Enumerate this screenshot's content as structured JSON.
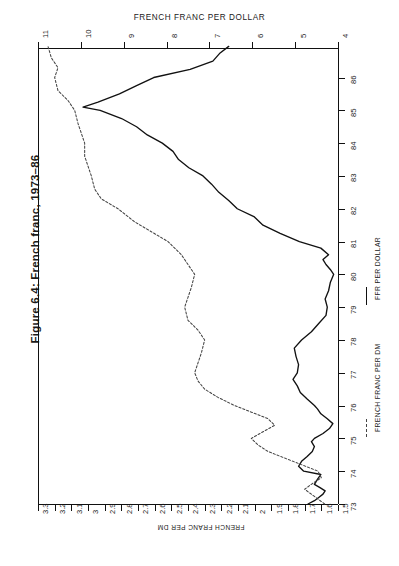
{
  "figure": {
    "caption": "Figure 6.4: French franc, 1973–86",
    "title": "FRENCH FRANC PER DOLLAR",
    "bottom_axis_label": "FRENCH FRANC PER DM"
  },
  "legend": {
    "solid_label": "FFR PER DOLLAR",
    "solid_marker": "solid-line-swatch",
    "dotted_label": "FRENCH FRANC PER DM",
    "dotted_marker": "dashed-line-swatch"
  },
  "colors": {
    "ink": "#111111",
    "dotted_ink": "#444444",
    "paper": "#ffffff"
  },
  "chart_data": {
    "type": "line",
    "orientation": "rotated-90-ccw",
    "title": "FRENCH FRANC PER DOLLAR",
    "xlabel": "",
    "ylabel": "",
    "grid": false,
    "legend_position": "right-inside",
    "time_axis": {
      "name": "year",
      "ticks": [
        "73",
        "74",
        "75",
        "76",
        "77",
        "78",
        "79",
        "80",
        "81",
        "82",
        "83",
        "84",
        "85",
        "86"
      ],
      "range": [
        1973,
        1986.9
      ],
      "direction": "bottom-to-top"
    },
    "value_axis_top": {
      "name": "FRENCH FRANC PER DOLLAR",
      "ticks": [
        "11",
        "10",
        "9",
        "8",
        "7",
        "6",
        "5",
        "4"
      ],
      "range": [
        11,
        4
      ],
      "direction": "left-to-right-descending"
    },
    "value_axis_bottom": {
      "name": "FRENCH FRANC PER DM",
      "ticks": [
        "3.3",
        "3.2",
        "3.1",
        "3",
        "2.9",
        "2.8",
        "2.7",
        "2.6",
        "2.5",
        "2.4",
        "2.3",
        "2.2",
        "2.1",
        "2",
        "1.9",
        "1.8",
        "1.7",
        "1.6",
        "1.5"
      ],
      "range": [
        3.3,
        1.5
      ],
      "direction": "left-to-right-descending"
    },
    "series": [
      {
        "name": "FFR PER DOLLAR",
        "style": "solid",
        "unit": "francs per US dollar",
        "x": [
          1973.0,
          1973.1,
          1973.2,
          1973.3,
          1973.4,
          1973.5,
          1973.6,
          1973.75,
          1973.9,
          1974.0,
          1974.15,
          1974.3,
          1974.45,
          1974.6,
          1974.75,
          1974.9,
          1975.0,
          1975.15,
          1975.3,
          1975.45,
          1975.6,
          1975.75,
          1975.9,
          1976.0,
          1976.2,
          1976.4,
          1976.6,
          1976.8,
          1977.0,
          1977.25,
          1977.5,
          1977.75,
          1978.0,
          1978.25,
          1978.5,
          1978.75,
          1979.0,
          1979.25,
          1979.5,
          1979.75,
          1980.0,
          1980.15,
          1980.3,
          1980.45,
          1980.6,
          1980.8,
          1981.0,
          1981.25,
          1981.5,
          1981.75,
          1982.0,
          1982.25,
          1982.5,
          1982.75,
          1983.0,
          1983.25,
          1983.5,
          1983.75,
          1984.0,
          1984.25,
          1984.5,
          1984.75,
          1985.0,
          1985.1,
          1985.25,
          1985.5,
          1985.75,
          1986.0,
          1986.25,
          1986.5,
          1986.75,
          1986.95
        ],
        "y": [
          4.7,
          4.55,
          4.45,
          4.35,
          4.3,
          4.42,
          4.55,
          4.48,
          4.4,
          4.8,
          4.92,
          4.85,
          4.72,
          4.6,
          4.55,
          4.62,
          4.55,
          4.35,
          4.2,
          4.12,
          4.25,
          4.4,
          4.48,
          4.55,
          4.72,
          4.88,
          4.95,
          5.05,
          4.95,
          4.92,
          4.98,
          5.02,
          4.85,
          4.62,
          4.45,
          4.28,
          4.25,
          4.3,
          4.22,
          4.18,
          4.1,
          4.18,
          4.28,
          4.35,
          4.22,
          4.4,
          4.9,
          5.35,
          5.75,
          5.95,
          6.35,
          6.55,
          6.78,
          6.95,
          7.15,
          7.48,
          7.72,
          7.85,
          8.1,
          8.45,
          8.7,
          9.05,
          9.55,
          9.95,
          9.6,
          9.1,
          8.7,
          8.3,
          7.45,
          6.92,
          6.75,
          6.55
        ]
      },
      {
        "name": "FRENCH FRANC PER DM",
        "style": "dotted",
        "unit": "francs per deutsche mark",
        "x": [
          1973.0,
          1973.15,
          1973.3,
          1973.45,
          1973.6,
          1973.8,
          1974.0,
          1974.2,
          1974.4,
          1974.6,
          1974.8,
          1975.0,
          1975.2,
          1975.4,
          1975.6,
          1975.8,
          1976.0,
          1976.25,
          1976.5,
          1976.75,
          1977.0,
          1977.3,
          1977.6,
          1978.0,
          1978.3,
          1978.6,
          1979.0,
          1979.3,
          1979.6,
          1980.0,
          1980.3,
          1980.6,
          1981.0,
          1981.3,
          1981.6,
          1982.0,
          1982.3,
          1982.6,
          1983.0,
          1983.3,
          1983.6,
          1984.0,
          1984.3,
          1984.6,
          1985.0,
          1985.3,
          1985.6,
          1986.0,
          1986.3,
          1986.6,
          1986.95
        ],
        "y": [
          1.58,
          1.62,
          1.66,
          1.7,
          1.66,
          1.6,
          1.62,
          1.72,
          1.82,
          1.92,
          1.98,
          2.02,
          1.95,
          1.88,
          1.92,
          2.02,
          2.12,
          2.22,
          2.3,
          2.34,
          2.36,
          2.34,
          2.32,
          2.3,
          2.34,
          2.4,
          2.42,
          2.4,
          2.38,
          2.36,
          2.4,
          2.44,
          2.52,
          2.62,
          2.72,
          2.82,
          2.92,
          2.96,
          2.98,
          3.0,
          3.02,
          3.02,
          3.04,
          3.06,
          3.08,
          3.12,
          3.18,
          3.2,
          3.18,
          3.22,
          3.24
        ]
      }
    ]
  }
}
